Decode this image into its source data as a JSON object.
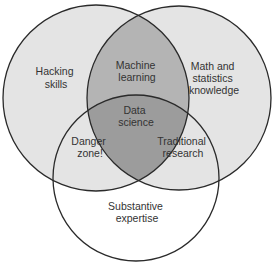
{
  "diagram": {
    "type": "venn",
    "circles": [
      {
        "id": "hacking",
        "label_lines": [
          "Hacking",
          "skills"
        ]
      },
      {
        "id": "math",
        "label_lines": [
          "Math and",
          "statistics",
          "knowledge"
        ]
      },
      {
        "id": "substantive",
        "label_lines": [
          "Substantive",
          "expertise"
        ]
      }
    ],
    "intersections": {
      "machine_learning": [
        "Machine",
        "learning"
      ],
      "danger_zone": [
        "Danger",
        "zone!"
      ],
      "traditional_research": [
        "Traditional",
        "research"
      ],
      "data_science": [
        "Data",
        "science"
      ]
    },
    "colors": {
      "single": "#e4e4e4",
      "double": "#b4b4b4",
      "triple": "#9c9c9c",
      "outline": "#2a2a2a",
      "text": "#333333"
    }
  }
}
